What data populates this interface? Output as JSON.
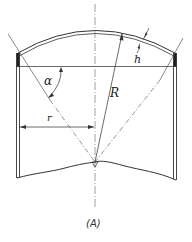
{
  "figure": {
    "caption": "(A)",
    "labels": {
      "alpha": "α",
      "R": "R",
      "r": "r",
      "h": "h"
    },
    "colors": {
      "line": "#333333",
      "centerline": "#777777",
      "background": "#ffffff"
    }
  }
}
